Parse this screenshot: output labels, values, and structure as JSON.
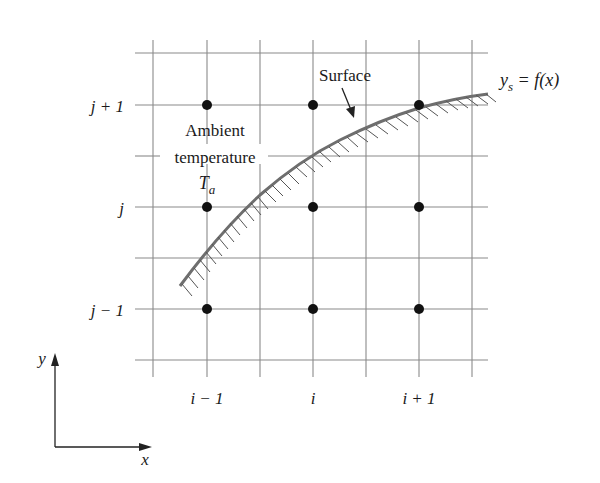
{
  "diagram": {
    "type": "finite-difference grid near curved surface",
    "row_labels": [
      "j + 1",
      "j",
      "j − 1"
    ],
    "col_labels": [
      "i − 1",
      "i",
      "i + 1"
    ],
    "ambient": {
      "line1": "Ambient",
      "line2": "temperature",
      "symbol": "T",
      "subscript": "a"
    },
    "surface_label": "Surface",
    "equation": {
      "lhs": "y",
      "lhs_sub": "s",
      "rhs": " = f(x)"
    },
    "axes": {
      "x_label": "x",
      "y_label": "y"
    },
    "colors": {
      "grid": "#8a8a8a",
      "curve": "#6e6e6e",
      "hatch": "#555555",
      "node": "#111111",
      "text": "#1a1a1a"
    }
  }
}
